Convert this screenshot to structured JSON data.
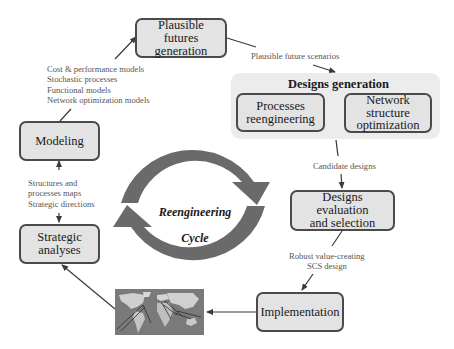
{
  "diagram": {
    "center": {
      "title_line1": "Reengineering",
      "title_line2": "Cycle"
    },
    "nodes": {
      "plausible_futures": "Plausible futures\ngeneration",
      "designs_generation": {
        "title": "Designs generation",
        "processes_reengineering": "Processes\nreengineering",
        "network_structure_optimization": "Network\nstructure\noptimization"
      },
      "designs_evaluation": "Designs evaluation\nand selection",
      "implementation": "Implementation",
      "strategic_analyses": "Strategic\nanalyses",
      "modeling": "Modeling"
    },
    "edge_labels": {
      "plausible_future_scenarios": "Plausible future scenarios",
      "candidate_designs": "Candidate designs",
      "robust_design": "Robust value-creating\nSCS design",
      "structures_maps": "Structures and\n    processes maps\nStrategic directions",
      "models": "Cost & performance models\nStochastic processes\nFunctional models\nNetwork optimization models"
    },
    "image": {
      "world_map": "world-map-network-image"
    },
    "colors": {
      "box_fill": "#e3e3e3",
      "box_border": "#4a4a4a",
      "group_fill": "#ececec",
      "cycle_arrow": "#6a6a6a",
      "connector": "#3a3a3a",
      "label_text": "#555555"
    }
  }
}
